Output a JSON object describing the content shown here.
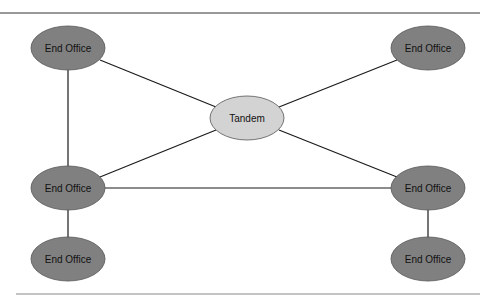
{
  "diagram": {
    "colors": {
      "end_office_fill": "#808080",
      "tandem_fill": "#d3d3d3",
      "stroke": "#1a1a1a",
      "rule": "#777777"
    },
    "nodes": [
      {
        "id": "eo_top_left",
        "label": "End Office",
        "type": "end_office"
      },
      {
        "id": "eo_top_right",
        "label": "End Office",
        "type": "end_office"
      },
      {
        "id": "tandem",
        "label": "Tandem",
        "type": "tandem"
      },
      {
        "id": "eo_mid_left",
        "label": "End Office",
        "type": "end_office"
      },
      {
        "id": "eo_mid_right",
        "label": "End Office",
        "type": "end_office"
      },
      {
        "id": "eo_bottom_left",
        "label": "End Office",
        "type": "end_office"
      },
      {
        "id": "eo_bottom_right",
        "label": "End Office",
        "type": "end_office"
      }
    ],
    "edges": [
      {
        "from": "eo_top_left",
        "to": "tandem"
      },
      {
        "from": "eo_top_right",
        "to": "tandem"
      },
      {
        "from": "eo_mid_left",
        "to": "tandem"
      },
      {
        "from": "eo_mid_right",
        "to": "tandem"
      },
      {
        "from": "eo_top_left",
        "to": "eo_mid_left"
      },
      {
        "from": "eo_mid_left",
        "to": "eo_mid_right"
      },
      {
        "from": "eo_mid_left",
        "to": "eo_bottom_left"
      },
      {
        "from": "eo_mid_right",
        "to": "eo_bottom_right"
      }
    ]
  }
}
